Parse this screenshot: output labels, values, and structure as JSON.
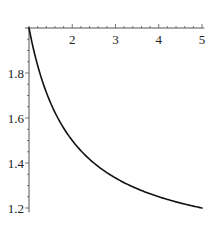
{
  "chart_data": {
    "type": "line",
    "title": "",
    "xlabel": "",
    "ylabel": "",
    "function": "1 + 1/x",
    "xlim": [
      1,
      5.03
    ],
    "ylim": [
      1.185,
      2.0
    ],
    "axes_origin": [
      1,
      2
    ],
    "x_axis_position": "top",
    "grid": false,
    "legend": null,
    "x_ticks": [
      2,
      3,
      4,
      5
    ],
    "x_tick_labels": [
      "2",
      "3",
      "4",
      "5"
    ],
    "y_ticks": [
      1.2,
      1.4,
      1.6,
      1.8
    ],
    "y_tick_labels": [
      "1.2",
      "1.4",
      "1.6",
      "1.8"
    ],
    "series": [
      {
        "name": "y = 1 + 1/x",
        "color": "#111111",
        "x": [
          1.0,
          1.25,
          1.5,
          1.75,
          2.0,
          2.5,
          3.0,
          3.5,
          4.0,
          4.5,
          5.0
        ],
        "y": [
          2.0,
          1.8,
          1.667,
          1.571,
          1.5,
          1.4,
          1.333,
          1.286,
          1.25,
          1.222,
          1.2
        ]
      }
    ]
  }
}
